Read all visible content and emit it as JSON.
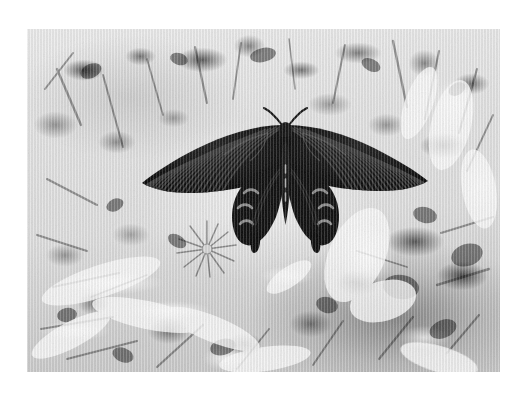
{
  "page": {
    "background_color": "#ffffff",
    "width": 523,
    "height": 397
  },
  "photo": {
    "alt_text": "Black and white photograph of a dark swallowtail butterfly with wings fully spread, resting among bright sunlit foliage and leaf litter",
    "subject": "swallowtail butterfly",
    "medium": "grayscale photograph",
    "frame": {
      "left": 27,
      "top": 29,
      "width": 473,
      "height": 343
    },
    "tones": {
      "paper_white": "#ffffff",
      "highlight": "#f2f2f2",
      "midtone": "#bcbcbc",
      "shadow": "#4a4a4a",
      "subject_black": "#0d0d0d"
    },
    "scene": {
      "background_label": "foliage and leaf litter",
      "flower_label": "radial flower blossom",
      "lighting": "high-key overexposed daylight"
    },
    "subject_detail": {
      "label": "swallowtail butterfly",
      "wing_span_px": 268,
      "body_center_x_px": 272,
      "left_wingtip_x_px": 140,
      "right_wingtip_x_px": 408,
      "forewing_striation_count": 26,
      "hindwing_lunule_count": 8,
      "tail_count": 2,
      "antenna_count": 2,
      "wing_color": "#0a0a0a",
      "striation_color": "#3c3c3c",
      "lunule_color": "#9a9a9a"
    }
  }
}
